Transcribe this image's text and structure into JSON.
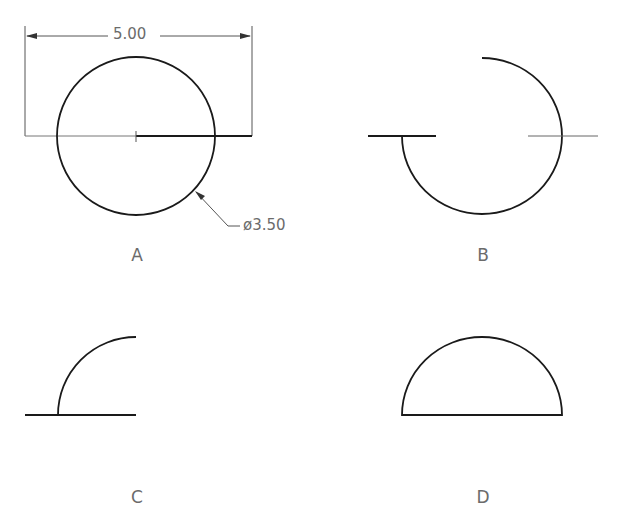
{
  "figures": [
    {
      "id": "A",
      "label": "A",
      "shape": "full-circle-with-dimensions"
    },
    {
      "id": "B",
      "label": "B",
      "shape": "three-quarter-arc"
    },
    {
      "id": "C",
      "label": "C",
      "shape": "quarter-arc-with-baseline"
    },
    {
      "id": "D",
      "label": "D",
      "shape": "semicircle"
    }
  ],
  "dimensions": {
    "width": "5.00",
    "diameter": "ø3.50"
  },
  "colors": {
    "stroke": "#1a1a1a",
    "thin_stroke": "#555555",
    "text": "#6b6b6b",
    "background": "#ffffff"
  }
}
